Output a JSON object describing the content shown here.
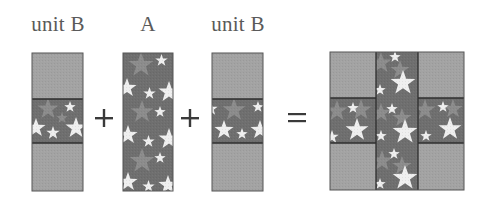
{
  "labels": {
    "unit_b_left": "unit B",
    "a": "A",
    "unit_b_right": "unit B"
  },
  "operators": {
    "plus": "+",
    "equals": "="
  },
  "colors": {
    "plain_fabric": "#a3a3a3",
    "star_fabric_bg": "#6f6f6f",
    "star_mid": "#8c8c8c",
    "star_light": "#efefef",
    "seam": "#3c3c3c",
    "operator": "#3a3a3a",
    "label_text": "#5a5a5a"
  },
  "pieces": [
    {
      "name": "unit B",
      "type": "unit-b",
      "x": 32,
      "y": 53,
      "w": 51,
      "h": 138
    },
    {
      "name": "A",
      "type": "strip-a",
      "x": 123,
      "y": 53,
      "w": 50,
      "h": 138
    },
    {
      "name": "unit B",
      "type": "unit-b",
      "x": 212,
      "y": 53,
      "w": 51,
      "h": 138
    },
    {
      "name": "result",
      "type": "block",
      "x": 330,
      "y": 52,
      "w": 134,
      "h": 138
    }
  ]
}
